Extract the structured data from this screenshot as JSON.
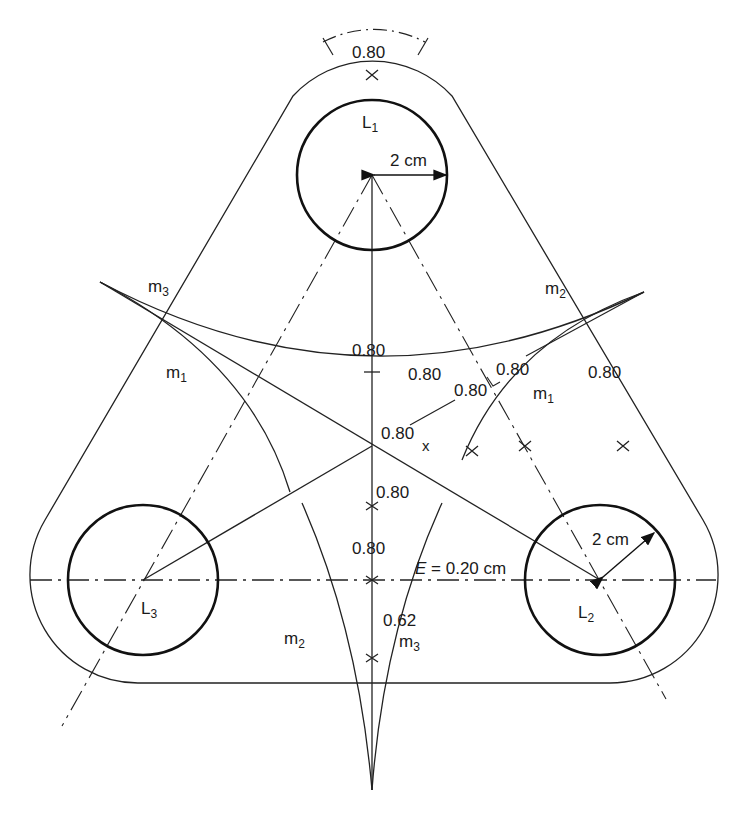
{
  "diagram": {
    "loads": [
      {
        "id": "L1",
        "label": "L",
        "sub": "1",
        "radius_label": "2 cm"
      },
      {
        "id": "L2",
        "label": "L",
        "sub": "2",
        "radius_label": "2 cm"
      },
      {
        "id": "L3",
        "label": "L",
        "sub": "3"
      }
    ],
    "markings": {
      "m1_left": {
        "label": "m",
        "sub": "1"
      },
      "m1_right": {
        "label": "m",
        "sub": "1"
      },
      "m2_top_right": {
        "label": "m",
        "sub": "2"
      },
      "m2_bottom": {
        "label": "m",
        "sub": "2"
      },
      "m3_top_left": {
        "label": "m",
        "sub": "3"
      },
      "m3_bottom": {
        "label": "m",
        "sub": "3"
      }
    },
    "dimensions": {
      "top": "0.80",
      "arc_center": "0.80",
      "right_a": "0.80",
      "right_b": "0.80",
      "right_c": "0.80",
      "right_d": "0.80",
      "right_outer": "0.80",
      "centroid": "0.80",
      "x_mark": "x",
      "below_centroid": "0.80",
      "mid_axis": "0.80",
      "bottom": "0.62",
      "eccentricity": "E = 0.20 cm",
      "eccentricity_symbol": "E",
      "eccentricity_value": "= 0.20 cm"
    }
  }
}
